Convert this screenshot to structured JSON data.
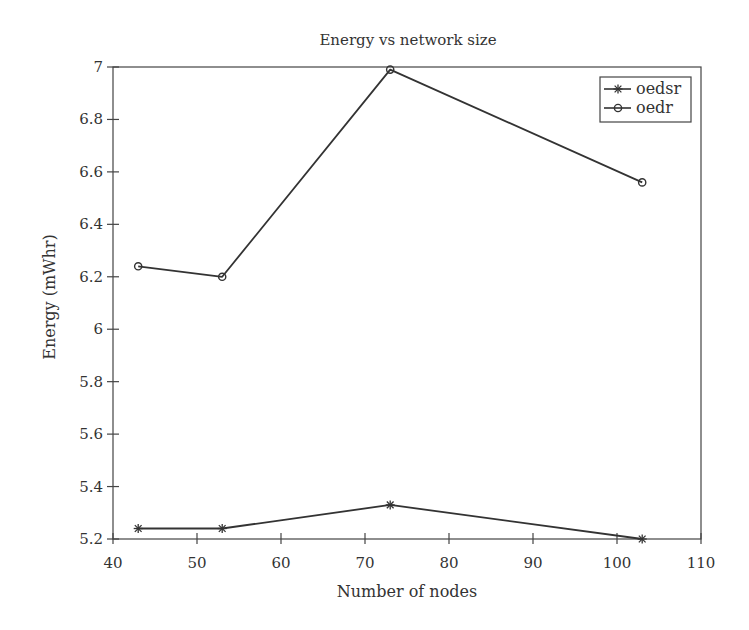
{
  "chart_data": {
    "type": "line",
    "title": "Energy vs network size",
    "xlabel": "Number of nodes",
    "ylabel": "Energy (mWhr)",
    "x": [
      43,
      53,
      73,
      103
    ],
    "series": [
      {
        "name": "oedsr",
        "marker": "star",
        "values": [
          5.24,
          5.24,
          5.33,
          5.2
        ]
      },
      {
        "name": "oedr",
        "marker": "circle",
        "values": [
          6.24,
          6.2,
          6.99,
          6.56
        ]
      }
    ],
    "xlim": [
      40,
      110
    ],
    "ylim": [
      5.2,
      7
    ],
    "xticks": [
      40,
      50,
      60,
      70,
      80,
      90,
      100,
      110
    ],
    "yticks": [
      5.2,
      5.4,
      5.6,
      5.8,
      6,
      6.2,
      6.4,
      6.6,
      6.8,
      7
    ],
    "xtick_labels": [
      "40",
      "50",
      "60",
      "70",
      "80",
      "90",
      "100",
      "110"
    ],
    "ytick_labels": [
      "5.2",
      "5.4",
      "5.6",
      "5.8",
      "6",
      "6.2",
      "6.4",
      "6.6",
      "6.8",
      "7"
    ],
    "grid": false,
    "legend_position": "upper right",
    "line_color": "#333333"
  }
}
